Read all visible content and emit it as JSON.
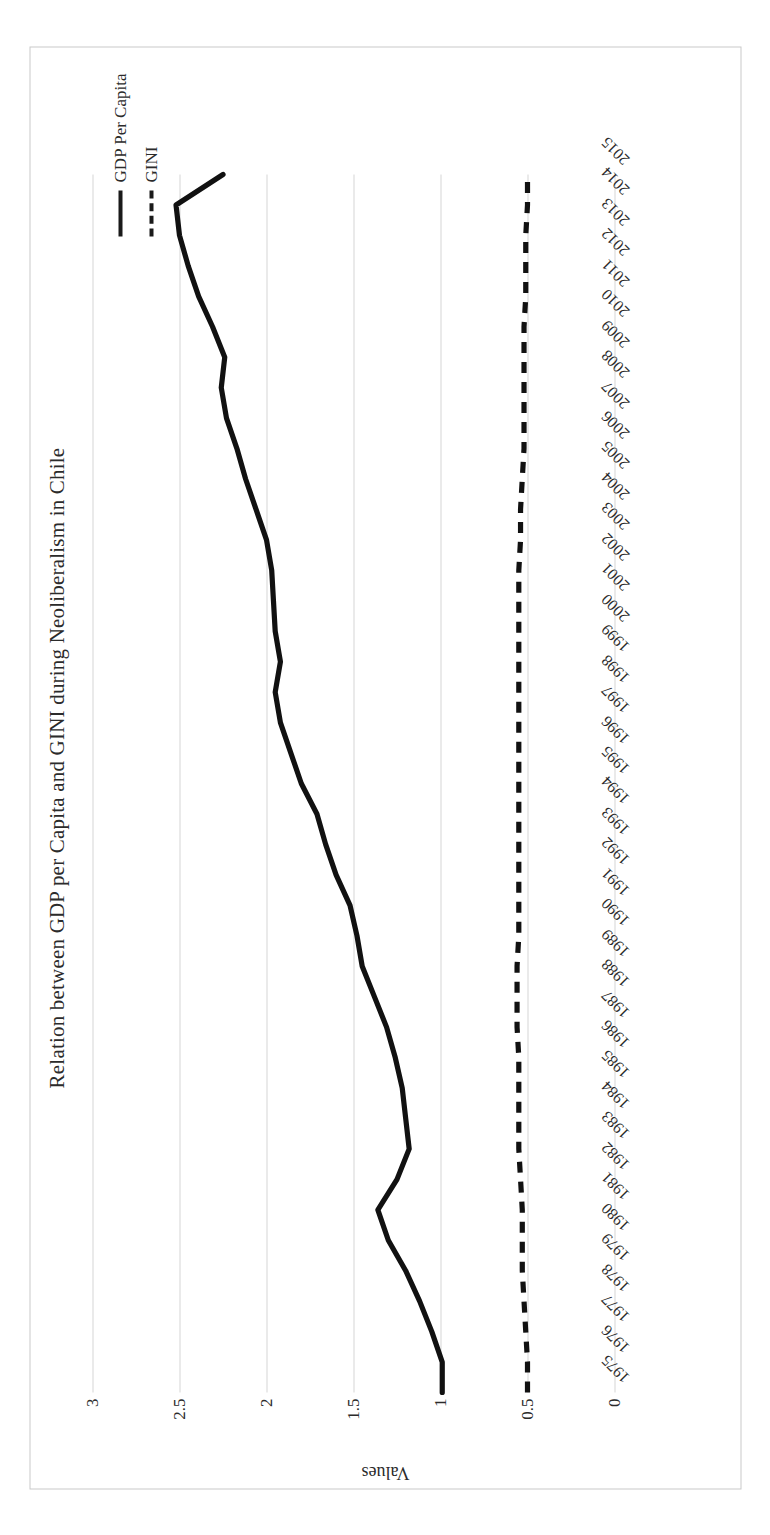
{
  "chart_data": {
    "type": "line",
    "title": "Relation between GDP per Capita and GINI during Neoliberalism in Chile",
    "xlabel": "",
    "ylabel": "Values",
    "ylim": [
      0,
      3
    ],
    "yticks": [
      "0",
      "0.5",
      "1",
      "1.5",
      "2",
      "2.5",
      "3"
    ],
    "ytick_values": [
      0,
      0.5,
      1,
      1.5,
      2,
      2.5,
      3
    ],
    "grid": true,
    "legend_position": "right",
    "orientation": "rotated-90-ccw",
    "categories": [
      "1975",
      "1976",
      "1977",
      "1978",
      "1979",
      "1980",
      "1981",
      "1982",
      "1983",
      "1984",
      "1985",
      "1986",
      "1987",
      "1988",
      "1989",
      "1990",
      "1991",
      "1992",
      "1993",
      "1994",
      "1995",
      "1996",
      "1997",
      "1998",
      "1999",
      "2000",
      "2001",
      "2002",
      "2003",
      "2004",
      "2005",
      "2006",
      "2007",
      "2008",
      "2009",
      "2010",
      "2011",
      "2012",
      "2013",
      "2014",
      "2015"
    ],
    "series": [
      {
        "name": "GDP Per Capita",
        "style": "solid",
        "color": "#111111",
        "values": [
          0.99,
          0.99,
          1.05,
          1.12,
          1.2,
          1.3,
          1.36,
          1.25,
          1.18,
          1.2,
          1.22,
          1.26,
          1.31,
          1.38,
          1.45,
          1.48,
          1.52,
          1.6,
          1.66,
          1.71,
          1.8,
          1.86,
          1.92,
          1.95,
          1.92,
          1.95,
          1.96,
          1.97,
          2.0,
          2.06,
          2.12,
          2.17,
          2.23,
          2.26,
          2.24,
          2.31,
          2.39,
          2.45,
          2.5,
          2.52,
          2.25
        ]
      },
      {
        "name": "GINI",
        "style": "dashed",
        "color": "#111111",
        "values": [
          0.5,
          0.5,
          0.51,
          0.52,
          0.53,
          0.53,
          0.53,
          0.54,
          0.55,
          0.55,
          0.55,
          0.55,
          0.56,
          0.56,
          0.56,
          0.55,
          0.55,
          0.55,
          0.55,
          0.55,
          0.55,
          0.55,
          0.55,
          0.55,
          0.55,
          0.55,
          0.55,
          0.55,
          0.54,
          0.54,
          0.53,
          0.52,
          0.52,
          0.52,
          0.52,
          0.52,
          0.51,
          0.51,
          0.51,
          0.5,
          0.5
        ]
      }
    ]
  },
  "legend": {
    "items": [
      {
        "label": "GDP Per Capita",
        "style": "solid"
      },
      {
        "label": "GINI",
        "style": "dashed"
      }
    ]
  },
  "axis": {
    "y_title": "Values"
  }
}
